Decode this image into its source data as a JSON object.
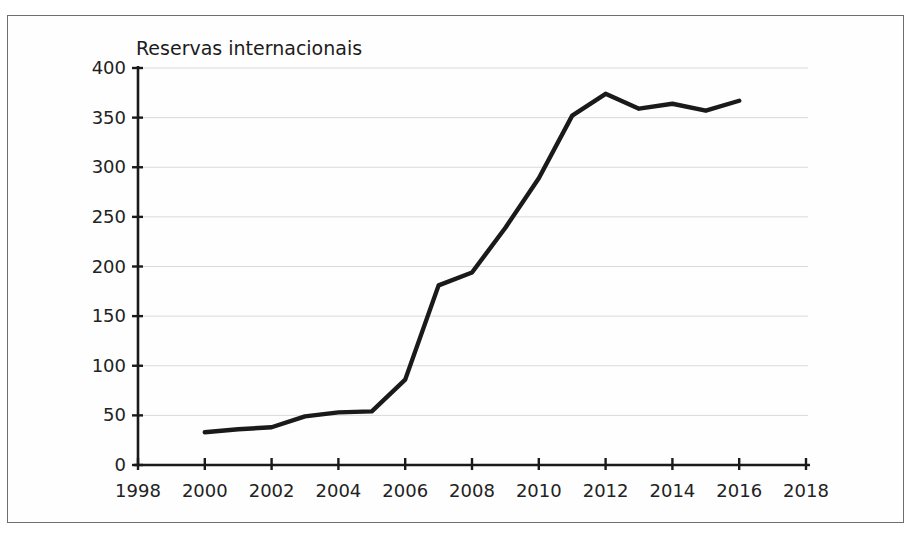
{
  "chart_data": {
    "type": "line",
    "title": "Reservas internacionais",
    "xlabel": "",
    "ylabel": "",
    "xlim": [
      1998,
      2018
    ],
    "ylim": [
      0,
      400
    ],
    "grid": true,
    "legend": "none",
    "line_color": "#1a1a1a",
    "grid_color": "#d9d9d9",
    "axis_color": "#1a1a1a",
    "background_color": "#fefefe",
    "border_color": "#6e6e6e",
    "yticks": [
      0,
      50,
      100,
      150,
      200,
      250,
      300,
      350,
      400
    ],
    "ytick_labels": [
      "0",
      "50",
      "100",
      "150",
      "200",
      "250",
      "300",
      "350",
      "400"
    ],
    "xticks": [
      1998,
      2000,
      2002,
      2004,
      2006,
      2008,
      2010,
      2012,
      2014,
      2016,
      2018
    ],
    "xtick_labels": [
      "1998",
      "2000",
      "2002",
      "2004",
      "2006",
      "2008",
      "2010",
      "2012",
      "2014",
      "2016",
      "2018"
    ],
    "series": [
      {
        "name": "Reservas internacionais",
        "x": [
          2000,
          2001,
          2002,
          2003,
          2004,
          2005,
          2006,
          2007,
          2008,
          2009,
          2010,
          2011,
          2012,
          2013,
          2014,
          2015,
          2016
        ],
        "values": [
          33,
          36,
          38,
          49,
          53,
          54,
          86,
          181,
          194,
          239,
          289,
          352,
          374,
          359,
          364,
          357,
          367
        ]
      }
    ]
  }
}
